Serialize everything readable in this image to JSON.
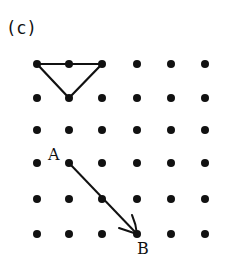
{
  "figure": {
    "panel_label": "(c)",
    "grid": {
      "columns": [
        37,
        69,
        102,
        137,
        171,
        205
      ],
      "rows": [
        64,
        98,
        130,
        163,
        199,
        234
      ],
      "dot_radius": 4,
      "dot_color": "#111111"
    },
    "triangle": {
      "points": [
        [
          37,
          64
        ],
        [
          102,
          64
        ],
        [
          69,
          98
        ]
      ],
      "stroke": "#111111"
    },
    "segment": {
      "from": "A",
      "to": "B",
      "passes_through": [
        102,
        199
      ]
    },
    "points": {
      "A": {
        "label": "A",
        "x": 69,
        "y": 163,
        "label_x": 48,
        "label_y": 160
      },
      "B": {
        "label": "B",
        "x": 137,
        "y": 234,
        "label_x": 137,
        "label_y": 254
      }
    }
  }
}
